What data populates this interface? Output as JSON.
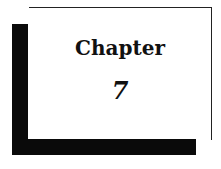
{
  "page": {
    "heading": "Chapter",
    "chapter_number": "7"
  }
}
